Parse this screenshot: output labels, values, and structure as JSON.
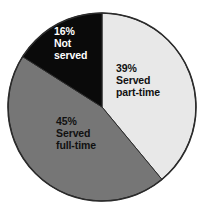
{
  "chart_data": {
    "type": "pie",
    "title": "",
    "subtitle": "",
    "xlabel": "",
    "ylabel": "",
    "legend_position": "none",
    "labels_inside_slices": true,
    "start_angle_deg": 0,
    "direction": "clockwise",
    "categories": [
      "Served part-time",
      "Served full-time",
      "Not served"
    ],
    "values": [
      39,
      45,
      16
    ],
    "value_unit": "%",
    "slices": [
      {
        "name": "Served part-time",
        "value": 39,
        "percent_label": "39%",
        "name_line_1": "Served",
        "name_line_2": "part-time",
        "color": "#e8e8e8",
        "text_color": "#111111",
        "start_deg": 0,
        "end_deg": 140.4
      },
      {
        "name": "Served full-time",
        "value": 45,
        "percent_label": "45%",
        "name_line_1": "Served",
        "name_line_2": "full-time",
        "color": "#767676",
        "text_color": "#111111",
        "start_deg": 140.4,
        "end_deg": 302.4
      },
      {
        "name": "Not served",
        "value": 16,
        "percent_label": "16%",
        "name_line_1": "Not",
        "name_line_2": "served",
        "color": "#0a0a0a",
        "text_color": "#ffffff",
        "start_deg": 302.4,
        "end_deg": 360
      }
    ],
    "geometry": {
      "center_x": 102,
      "center_y": 107,
      "radius": 94
    },
    "colors": {
      "background": "#ffffff",
      "outline": "#2b2b2b",
      "part_time": "#e8e8e8",
      "full_time": "#767676",
      "not_served": "#0a0a0a"
    }
  }
}
